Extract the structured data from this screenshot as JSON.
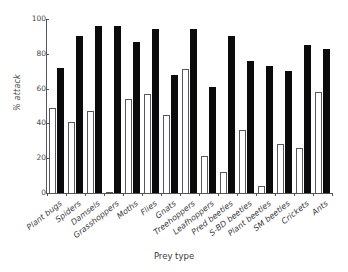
{
  "chart_data": {
    "type": "bar",
    "title": "",
    "xlabel": "Prey type",
    "ylabel": "% attack",
    "ylim": [
      0,
      100
    ],
    "yticks": [
      0,
      20,
      40,
      60,
      80,
      100
    ],
    "ytick_labels": [
      "0",
      "20",
      "40",
      "60",
      "80",
      "100"
    ],
    "grid": false,
    "legend": "none",
    "categories": [
      "Plant bugs",
      "Spiders",
      "Damsels",
      "Grasshoppers",
      "Moths",
      "Flies",
      "Gnats",
      "Treehoppers",
      "Leafhoppers",
      "Pred beetles",
      "S-BD beetles",
      "Plant beetles",
      "SM beetles",
      "Crickets",
      "Ants"
    ],
    "series": [
      {
        "name": "open",
        "style": "white bar with black outline",
        "color": "#ffffff",
        "edge_color": "#55585c",
        "values": [
          49,
          41,
          47,
          0.5,
          54,
          57,
          45,
          71,
          21,
          12,
          36,
          4,
          28,
          26,
          58
        ]
      },
      {
        "name": "filled",
        "style": "solid black bar",
        "color": "#0b0b0b",
        "edge_color": "#0b0b0b",
        "values": [
          72,
          90,
          96,
          96,
          87,
          94,
          68,
          94,
          61,
          90,
          76,
          73,
          70,
          85,
          83
        ]
      }
    ]
  }
}
